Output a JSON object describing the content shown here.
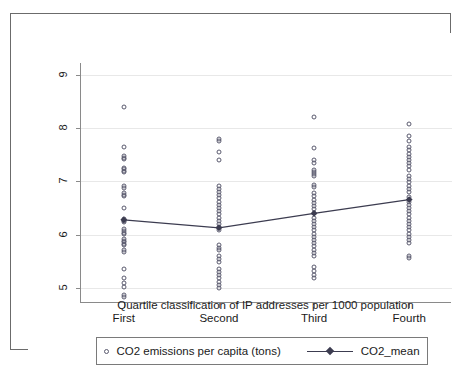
{
  "chart_data": {
    "type": "scatter",
    "title": "",
    "xlabel": "Quartile classification of IP addresses per 1000 population",
    "ylabel": "",
    "categories": [
      "First",
      "Second",
      "Third",
      "Fourth"
    ],
    "x": [
      1,
      2,
      3,
      4
    ],
    "xlim": [
      0.55,
      4.45
    ],
    "ylim": [
      4.72,
      9.22
    ],
    "yticks": [
      5,
      6,
      7,
      8,
      9
    ],
    "yticklabels": [
      "5",
      "6",
      "7",
      "8",
      "9"
    ],
    "grid": true,
    "legend_position": "bottom",
    "series": [
      {
        "name": "CO2 emissions per capita (tons)",
        "type": "scatter",
        "marker": "open-circle",
        "color": "#5a5a6e",
        "points": [
          {
            "x": 1,
            "y": 8.4
          },
          {
            "x": 1,
            "y": 7.65
          },
          {
            "x": 1,
            "y": 7.47
          },
          {
            "x": 1,
            "y": 7.44
          },
          {
            "x": 1,
            "y": 7.42
          },
          {
            "x": 1,
            "y": 7.26
          },
          {
            "x": 1,
            "y": 7.23
          },
          {
            "x": 1,
            "y": 7.2
          },
          {
            "x": 1,
            "y": 7.17
          },
          {
            "x": 1,
            "y": 6.91
          },
          {
            "x": 1,
            "y": 6.88
          },
          {
            "x": 1,
            "y": 6.78
          },
          {
            "x": 1,
            "y": 6.75
          },
          {
            "x": 1,
            "y": 6.72
          },
          {
            "x": 1,
            "y": 6.5
          },
          {
            "x": 1,
            "y": 6.29
          },
          {
            "x": 1,
            "y": 6.26
          },
          {
            "x": 1,
            "y": 6.23
          },
          {
            "x": 1,
            "y": 6.1
          },
          {
            "x": 1,
            "y": 6.07
          },
          {
            "x": 1,
            "y": 6.04
          },
          {
            "x": 1,
            "y": 6.01
          },
          {
            "x": 1,
            "y": 5.92
          },
          {
            "x": 1,
            "y": 5.89
          },
          {
            "x": 1,
            "y": 5.86
          },
          {
            "x": 1,
            "y": 5.83
          },
          {
            "x": 1,
            "y": 5.8
          },
          {
            "x": 1,
            "y": 5.71
          },
          {
            "x": 1,
            "y": 5.68
          },
          {
            "x": 1,
            "y": 5.35
          },
          {
            "x": 1,
            "y": 5.18
          },
          {
            "x": 1,
            "y": 5.1
          },
          {
            "x": 1,
            "y": 5.02
          },
          {
            "x": 1,
            "y": 4.87
          },
          {
            "x": 1,
            "y": 4.84
          },
          {
            "x": 2,
            "y": 7.79
          },
          {
            "x": 2,
            "y": 7.76
          },
          {
            "x": 2,
            "y": 7.55
          },
          {
            "x": 2,
            "y": 7.4
          },
          {
            "x": 2,
            "y": 6.92
          },
          {
            "x": 2,
            "y": 6.86
          },
          {
            "x": 2,
            "y": 6.8
          },
          {
            "x": 2,
            "y": 6.74
          },
          {
            "x": 2,
            "y": 6.68
          },
          {
            "x": 2,
            "y": 6.62
          },
          {
            "x": 2,
            "y": 6.56
          },
          {
            "x": 2,
            "y": 6.5
          },
          {
            "x": 2,
            "y": 6.44
          },
          {
            "x": 2,
            "y": 6.38
          },
          {
            "x": 2,
            "y": 6.32
          },
          {
            "x": 2,
            "y": 6.26
          },
          {
            "x": 2,
            "y": 6.2
          },
          {
            "x": 2,
            "y": 6.14
          },
          {
            "x": 2,
            "y": 6.08
          },
          {
            "x": 2,
            "y": 5.8
          },
          {
            "x": 2,
            "y": 5.76
          },
          {
            "x": 2,
            "y": 5.72
          },
          {
            "x": 2,
            "y": 5.6
          },
          {
            "x": 2,
            "y": 5.54
          },
          {
            "x": 2,
            "y": 5.48
          },
          {
            "x": 2,
            "y": 5.36
          },
          {
            "x": 2,
            "y": 5.3
          },
          {
            "x": 2,
            "y": 5.24
          },
          {
            "x": 2,
            "y": 5.18
          },
          {
            "x": 2,
            "y": 5.12
          },
          {
            "x": 2,
            "y": 5.06
          },
          {
            "x": 2,
            "y": 5.0
          },
          {
            "x": 3,
            "y": 8.21
          },
          {
            "x": 3,
            "y": 7.62
          },
          {
            "x": 3,
            "y": 7.4
          },
          {
            "x": 3,
            "y": 7.35
          },
          {
            "x": 3,
            "y": 7.22
          },
          {
            "x": 3,
            "y": 7.18
          },
          {
            "x": 3,
            "y": 7.14
          },
          {
            "x": 3,
            "y": 7.1
          },
          {
            "x": 3,
            "y": 6.94
          },
          {
            "x": 3,
            "y": 6.9
          },
          {
            "x": 3,
            "y": 6.78
          },
          {
            "x": 3,
            "y": 6.72
          },
          {
            "x": 3,
            "y": 6.66
          },
          {
            "x": 3,
            "y": 6.6
          },
          {
            "x": 3,
            "y": 6.54
          },
          {
            "x": 3,
            "y": 6.48
          },
          {
            "x": 3,
            "y": 6.4
          },
          {
            "x": 3,
            "y": 6.32
          },
          {
            "x": 3,
            "y": 6.26
          },
          {
            "x": 3,
            "y": 6.2
          },
          {
            "x": 3,
            "y": 6.14
          },
          {
            "x": 3,
            "y": 6.08
          },
          {
            "x": 3,
            "y": 6.02
          },
          {
            "x": 3,
            "y": 5.96
          },
          {
            "x": 3,
            "y": 5.9
          },
          {
            "x": 3,
            "y": 5.84
          },
          {
            "x": 3,
            "y": 5.78
          },
          {
            "x": 3,
            "y": 5.72
          },
          {
            "x": 3,
            "y": 5.66
          },
          {
            "x": 3,
            "y": 5.6
          },
          {
            "x": 3,
            "y": 5.4
          },
          {
            "x": 3,
            "y": 5.32
          },
          {
            "x": 3,
            "y": 5.24
          },
          {
            "x": 3,
            "y": 5.18
          },
          {
            "x": 4,
            "y": 8.08
          },
          {
            "x": 4,
            "y": 7.86
          },
          {
            "x": 4,
            "y": 7.76
          },
          {
            "x": 4,
            "y": 7.64
          },
          {
            "x": 4,
            "y": 7.58
          },
          {
            "x": 4,
            "y": 7.52
          },
          {
            "x": 4,
            "y": 7.46
          },
          {
            "x": 4,
            "y": 7.4
          },
          {
            "x": 4,
            "y": 7.34
          },
          {
            "x": 4,
            "y": 7.28
          },
          {
            "x": 4,
            "y": 7.22
          },
          {
            "x": 4,
            "y": 7.1
          },
          {
            "x": 4,
            "y": 7.04
          },
          {
            "x": 4,
            "y": 6.98
          },
          {
            "x": 4,
            "y": 6.92
          },
          {
            "x": 4,
            "y": 6.86
          },
          {
            "x": 4,
            "y": 6.8
          },
          {
            "x": 4,
            "y": 6.7
          },
          {
            "x": 4,
            "y": 6.62
          },
          {
            "x": 4,
            "y": 6.56
          },
          {
            "x": 4,
            "y": 6.5
          },
          {
            "x": 4,
            "y": 6.44
          },
          {
            "x": 4,
            "y": 6.38
          },
          {
            "x": 4,
            "y": 6.32
          },
          {
            "x": 4,
            "y": 6.26
          },
          {
            "x": 4,
            "y": 6.2
          },
          {
            "x": 4,
            "y": 6.14
          },
          {
            "x": 4,
            "y": 6.08
          },
          {
            "x": 4,
            "y": 6.02
          },
          {
            "x": 4,
            "y": 5.96
          },
          {
            "x": 4,
            "y": 5.9
          },
          {
            "x": 4,
            "y": 5.84
          },
          {
            "x": 4,
            "y": 5.6
          },
          {
            "x": 4,
            "y": 5.56
          }
        ]
      },
      {
        "name": "CO2_mean",
        "type": "line",
        "marker": "filled-diamond",
        "color": "#3c3c50",
        "values": [
          6.28,
          6.13,
          6.4,
          6.66
        ]
      }
    ]
  },
  "axis": {
    "y_tick_labels": [
      "9",
      "8",
      "7",
      "6",
      "5"
    ],
    "x_tick_labels": [
      "First",
      "Second",
      "Third",
      "Fourth"
    ],
    "x_title": "Quartile classification of IP addresses per 1000 population"
  },
  "legend": {
    "entries": [
      {
        "label": "CO2 emissions per capita (tons)",
        "marker": "open-circle"
      },
      {
        "label": "CO2_mean",
        "marker": "line-filled-diamond"
      }
    ]
  }
}
